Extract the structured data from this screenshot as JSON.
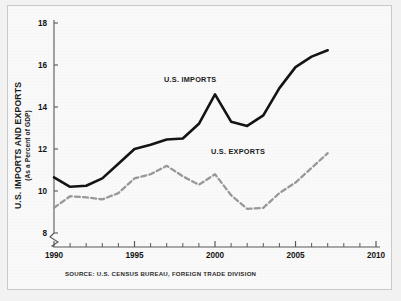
{
  "figure": {
    "source_note": "SOURCE: U.S. CENSUS BUREAU, FOREIGN TRADE DIVISION",
    "border_color": "#c9c9c9",
    "background_color": "#fbfbfb"
  },
  "chart_data": {
    "type": "line",
    "title": "",
    "xlabel": "",
    "ylabel": "U.S. IMPORTS AND EXPORTS",
    "ylabel_sub": "(As a Percent of GDP)",
    "xlim": [
      1990,
      2010
    ],
    "ylim": [
      7.4,
      18
    ],
    "grid": false,
    "legend_position": "inline-annotations",
    "y_axis_break": true,
    "xticks": [
      1990,
      1995,
      2000,
      2005,
      2010
    ],
    "xtick_labels": [
      "1990",
      "1995",
      "2000",
      "2005",
      "2010"
    ],
    "x_minor_ticks": [
      1991,
      1992,
      1993,
      1994,
      1996,
      1997,
      1998,
      1999,
      2001,
      2002,
      2003,
      2004,
      2006,
      2007,
      2008,
      2009
    ],
    "yticks": [
      8,
      10,
      12,
      14,
      16,
      18
    ],
    "ytick_labels": [
      "8",
      "10",
      "12",
      "14",
      "16",
      "18"
    ],
    "x": [
      1990,
      1991,
      1992,
      1993,
      1994,
      1995,
      1996,
      1997,
      1998,
      1999,
      2000,
      2001,
      2002,
      2003,
      2004,
      2005,
      2006,
      2007
    ],
    "series": [
      {
        "name": "U.S. IMPORTS",
        "label": "U.S. IMPORTS",
        "style": "solid",
        "color": "#141414",
        "width": 2.6,
        "values": [
          10.65,
          10.2,
          10.25,
          10.6,
          11.3,
          12.0,
          12.2,
          12.45,
          12.5,
          13.2,
          14.6,
          13.3,
          13.1,
          13.6,
          14.9,
          15.9,
          16.4,
          16.7
        ]
      },
      {
        "name": "U.S. EXPORTS",
        "label": "U.S. EXPORTS",
        "style": "dashed",
        "color": "#9a9a9a",
        "width": 2.3,
        "values": [
          9.2,
          9.75,
          9.7,
          9.6,
          9.9,
          10.6,
          10.8,
          11.2,
          10.7,
          10.3,
          10.8,
          9.8,
          9.15,
          9.2,
          9.9,
          10.4,
          11.1,
          11.8
        ]
      }
    ]
  }
}
